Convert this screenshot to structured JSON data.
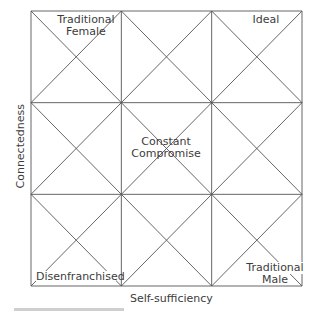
{
  "diagram": {
    "type": "3x3 grid with diagonals",
    "x_axis_label": "Self-sufficiency",
    "y_axis_label": "Connectedness",
    "cell_labels": {
      "top_left": [
        "Traditional",
        "Female"
      ],
      "top_right": [
        "Ideal"
      ],
      "center": [
        "Constant",
        "Compromise"
      ],
      "bottom_left": [
        "Disenfranchised"
      ],
      "bottom_right": [
        "Traditional",
        "Male"
      ]
    },
    "line_color": "#555555",
    "grid": {
      "left": 31,
      "top": 11,
      "right": 302,
      "bottom": 286,
      "rows": 3,
      "cols": 3
    }
  }
}
